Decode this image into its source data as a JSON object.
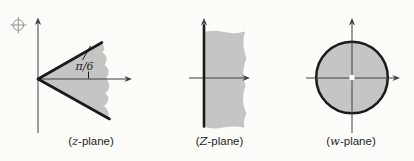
{
  "colors": {
    "bg": "#fcfcf9",
    "shade": "#c5c6c3",
    "edge": "#1a1a1a",
    "axis": "#3f3f3f",
    "text": "#1e1e1e",
    "mark": "#909294"
  },
  "panels": [
    {
      "shape": "shaded-wedge-sector",
      "annotation": "π/6",
      "label": {
        "prefix": "(",
        "variable": "z",
        "suffix": "-plane)"
      }
    },
    {
      "shape": "shaded-right-half-plane",
      "label": {
        "prefix": "(",
        "variable": "Z",
        "suffix": "-plane)"
      }
    },
    {
      "shape": "shaded-disk-with-open-center",
      "label": {
        "prefix": "(",
        "variable": "w",
        "suffix": "-plane)"
      }
    }
  ]
}
